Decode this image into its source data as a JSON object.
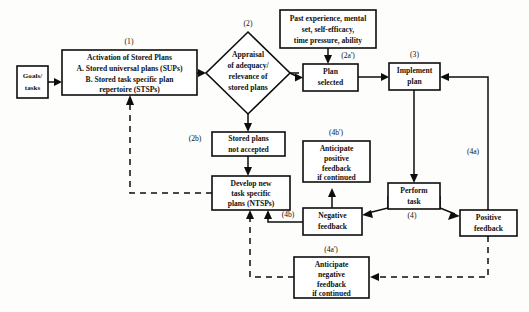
{
  "diagram": {
    "background_color": "#fdfdfb",
    "line_color": "#0d0d0d",
    "box_fill": "#ffffff",
    "nodes": {
      "goals": {
        "lines": [
          "Goals/",
          "tasks"
        ],
        "step": ""
      },
      "activation": {
        "lines": [
          "Activation of Stored Plans",
          "A. Stored universal plans (SUPs)",
          "B. Stored task specific plan",
          "repertoire (STSPs)"
        ],
        "step": "(1)"
      },
      "appraisal": {
        "lines": [
          "Appraisal",
          "of adequacy/",
          "relevance of",
          "stored plans"
        ],
        "step": "(2)"
      },
      "influences": {
        "lines": [
          "Past experience, mental",
          "set, self-efficacy,",
          "time pressure, ability"
        ],
        "step": ""
      },
      "plan_selected": {
        "lines": [
          "Plan",
          "selected"
        ],
        "step": "(2a')"
      },
      "implement_plan": {
        "lines": [
          "Implement",
          "plan"
        ],
        "step": "(3)"
      },
      "stored_not_accepted": {
        "lines": [
          "Stored plans",
          "not accepted"
        ],
        "step": "(2b)"
      },
      "develop_new": {
        "lines": [
          "Develop new",
          "task specific",
          "plans (NTSPs)"
        ],
        "step": ""
      },
      "anticipate_positive": {
        "lines": [
          "Anticipate",
          "positive",
          "feedback",
          "if continued"
        ],
        "step": "(4b')"
      },
      "negative_feedback": {
        "lines": [
          "Negative",
          "feedback"
        ],
        "step": "(4b)"
      },
      "perform_task": {
        "lines": [
          "Perform",
          "task"
        ],
        "step": "(4)"
      },
      "positive_feedback": {
        "lines": [
          "Positive",
          "feedback"
        ],
        "step": "(4a)"
      },
      "anticipate_negative": {
        "lines": [
          "Anticipate",
          "negative",
          "feedback",
          "if continued"
        ],
        "step": "(4a')"
      }
    }
  }
}
